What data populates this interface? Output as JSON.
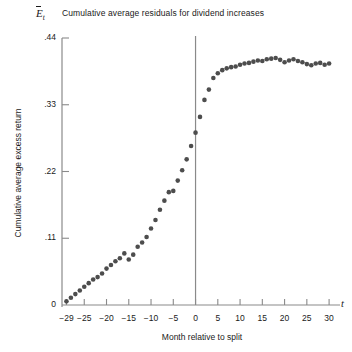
{
  "figure": {
    "title": "Cumulative average residuals for dividend increases",
    "y_axis_symbol_letter": "E",
    "y_axis_symbol_subscript": "t",
    "x_axis_symbol": "t",
    "x_axis_title": "Month relative to split",
    "y_axis_title": "Cumulative average excess return",
    "point_color": "#4d4d4d",
    "axis_color": "#8a8a8a",
    "text_color": "#1a1a1a"
  },
  "chart_data": {
    "type": "scatter",
    "title": "Cumulative average residuals for dividend increases",
    "xlabel": "Month relative to split",
    "ylabel": "Cumulative average excess return",
    "xlim": [
      -30,
      32
    ],
    "ylim": [
      0,
      0.44
    ],
    "grid": false,
    "legend": null,
    "event_line_x": 0,
    "xticks": [
      -29,
      -25,
      -20,
      -15,
      -10,
      -5,
      0,
      5,
      10,
      15,
      20,
      25,
      30
    ],
    "xticklabels": [
      "−29",
      "−25",
      "−20",
      "−15",
      "−10",
      "−5",
      "0",
      "5",
      "10",
      "15",
      "20",
      "25",
      "30"
    ],
    "yticks": [
      0,
      0.11,
      0.22,
      0.33,
      0.44
    ],
    "yticklabels": [
      "0",
      ".11",
      ".22",
      ".33",
      ".44"
    ],
    "x": [
      -29,
      -28,
      -27,
      -26,
      -25,
      -24,
      -23,
      -22,
      -21,
      -20,
      -19,
      -18,
      -17,
      -16,
      -15,
      -14,
      -13,
      -12,
      -11,
      -10,
      -9,
      -8,
      -7,
      -6,
      -5,
      -4,
      -3,
      -2,
      -1,
      0,
      1,
      2,
      3,
      4,
      5,
      6,
      7,
      8,
      9,
      10,
      11,
      12,
      13,
      14,
      15,
      16,
      17,
      18,
      19,
      20,
      21,
      22,
      23,
      24,
      25,
      26,
      27,
      28,
      29,
      30
    ],
    "y": [
      0.006,
      0.012,
      0.018,
      0.024,
      0.03,
      0.036,
      0.042,
      0.046,
      0.052,
      0.06,
      0.066,
      0.072,
      0.077,
      0.085,
      0.075,
      0.083,
      0.096,
      0.103,
      0.112,
      0.126,
      0.14,
      0.157,
      0.172,
      0.186,
      0.188,
      0.205,
      0.222,
      0.24,
      0.262,
      0.284,
      0.31,
      0.338,
      0.355,
      0.374,
      0.382,
      0.387,
      0.39,
      0.392,
      0.393,
      0.396,
      0.398,
      0.399,
      0.401,
      0.403,
      0.402,
      0.405,
      0.406,
      0.407,
      0.404,
      0.4,
      0.403,
      0.405,
      0.402,
      0.4,
      0.397,
      0.395,
      0.398,
      0.399,
      0.396,
      0.398
    ]
  }
}
